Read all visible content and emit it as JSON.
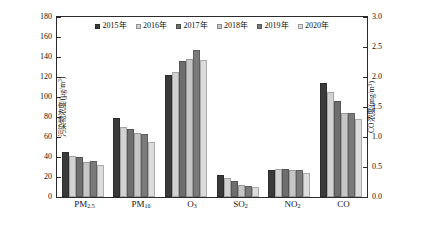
{
  "chart_data": {
    "type": "bar",
    "title": "",
    "subtitle": "",
    "categories": [
      "PM2.5",
      "PM10",
      "O3",
      "SO2",
      "NO2",
      "CO"
    ],
    "category_labels_html": [
      "PM<sub>2.5</sub>",
      "PM<sub>10</sub>",
      "O<sub>3</sub>",
      "SO<sub>2</sub>",
      "NO<sub>2</sub>",
      "CO"
    ],
    "series": [
      {
        "name": "2015年",
        "color": "#3a3a3a",
        "values": [
          45,
          79,
          122,
          22,
          27,
          1.9
        ]
      },
      {
        "name": "2016年",
        "color": "#d2d2d2",
        "values": [
          41,
          70,
          125,
          19,
          28,
          1.75
        ]
      },
      {
        "name": "2017年",
        "color": "#6e6e6e",
        "values": [
          40,
          68,
          136,
          16,
          28,
          1.6
        ]
      },
      {
        "name": "2018年",
        "color": "#c6c6c6",
        "values": [
          35,
          64,
          138,
          12,
          27,
          1.4
        ]
      },
      {
        "name": "2019年",
        "color": "#7a7a7a",
        "values": [
          36,
          63,
          147,
          11,
          27,
          1.4
        ]
      },
      {
        "name": "2020年",
        "color": "#dcdcdc",
        "values": [
          32,
          55,
          137,
          10,
          24,
          1.3
        ]
      }
    ],
    "secondary_axis_categories": [
      "CO"
    ],
    "xlabel": "",
    "ylabel": "污染物浓度/(μg/m³)",
    "ylabel_left_html": "污染物浓度/(&mu;g/m<sup>3</sup>)",
    "ylabel_right": "CO浓度/(mg/m³)",
    "ylabel_right_html": "CO浓度/(mg/m<sup>3</sup>)",
    "ylim": [
      0,
      180
    ],
    "yticks": [
      0,
      20,
      40,
      60,
      80,
      100,
      120,
      140,
      160,
      180
    ],
    "ylim_right": [
      0,
      3.0
    ],
    "yticks_right": [
      "0.0",
      "0.5",
      "1.0",
      "1.5",
      "2.0",
      "2.5",
      "3.0"
    ],
    "grid": false,
    "legend_position": "top-center"
  },
  "caption": {
    "text": ""
  }
}
